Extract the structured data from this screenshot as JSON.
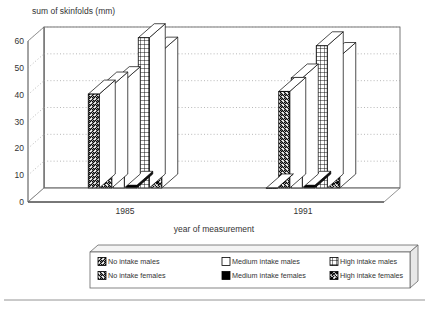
{
  "chart_data": {
    "type": "bar",
    "title": "sum of skinfolds (mm)",
    "xlabel": "year of measurement",
    "ylabel": "sum of skinfolds (mm)",
    "categories": [
      "1985",
      "1991"
    ],
    "ylim": [
      0,
      60
    ],
    "yticks": [
      0,
      10,
      20,
      30,
      40,
      50,
      60
    ],
    "grid": true,
    "legend_position": "bottom",
    "three_d": true,
    "series": [
      {
        "name": "No intake males",
        "pattern": "diagonal-up-hatch",
        "values": [
          35,
          0
        ]
      },
      {
        "name": "No intake females",
        "pattern": "diagonal-down-hatch",
        "values": [
          38,
          36
        ]
      },
      {
        "name": "Medium intake males",
        "pattern": "solid-white",
        "values": [
          40,
          41
        ]
      },
      {
        "name": "Medium intake females",
        "pattern": "solid-black",
        "values": [
          1,
          1
        ]
      },
      {
        "name": "High intake males",
        "pattern": "grid-hatch",
        "values": [
          56,
          53
        ]
      },
      {
        "name": "High intake females",
        "pattern": "cross-hatch",
        "values": [
          51,
          49
        ]
      }
    ]
  },
  "axes": {
    "title": "sum of skinfolds (mm)",
    "x_axis_label": "year of measurement",
    "y_tick_labels": [
      "0",
      "10",
      "20",
      "30",
      "40",
      "50",
      "60"
    ],
    "category_labels": [
      "1985",
      "1991"
    ]
  },
  "legend": {
    "entries": [
      {
        "label": "No intake males",
        "swatch": "diagonal-up-hatch"
      },
      {
        "label": "Medium intake males",
        "swatch": "solid-white"
      },
      {
        "label": "High intake males",
        "swatch": "grid-hatch"
      },
      {
        "label": "No intake females",
        "swatch": "diagonal-down-hatch"
      },
      {
        "label": "Medium intake females",
        "swatch": "solid-black"
      },
      {
        "label": "High intake females",
        "swatch": "cross-hatch"
      }
    ]
  },
  "colors": {
    "line": "#000000",
    "background": "#ffffff",
    "grid": "#999999",
    "text": "#333333",
    "fill_white": "#ffffff",
    "fill_black": "#000000",
    "panel_side": "#e8e8e8"
  }
}
